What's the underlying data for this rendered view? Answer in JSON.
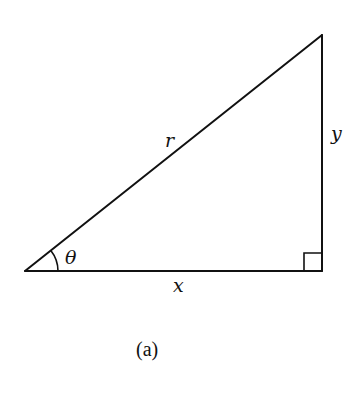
{
  "figure": {
    "caption": "(a)",
    "type": "right-triangle",
    "colors": {
      "stroke": "#111111",
      "background": "#ffffff"
    },
    "vertices": {
      "origin": {
        "x": 25,
        "y": 271
      },
      "top_right": {
        "x": 322,
        "y": 35
      },
      "right_angle": {
        "x": 322,
        "y": 271
      }
    },
    "labels": {
      "hypotenuse": "r",
      "opposite": "y",
      "adjacent": "x",
      "angle": "θ"
    },
    "markers": {
      "right_angle_marker": "square",
      "angle_marker": "arc"
    }
  }
}
